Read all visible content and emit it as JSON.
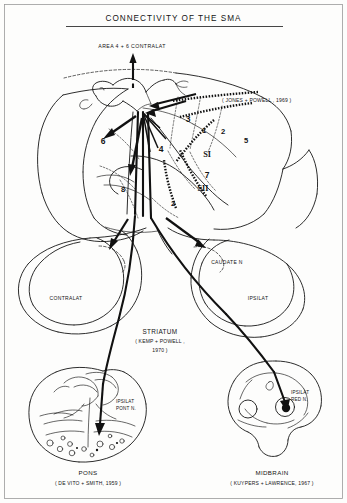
{
  "figure": {
    "title": "CONNECTIVITY OF THE SMA",
    "domain_note": "anatomical connectivity diagram of the supplementary motor area"
  },
  "cortex": {
    "top_arrow_label": "AREA 4 + 6 CONTRALAT",
    "citation": "( JONES + POWELL , 1969 )",
    "area_numbers": [
      {
        "id": "area-6",
        "label": "6"
      },
      {
        "id": "area-8",
        "label": "8"
      },
      {
        "id": "area-4",
        "label": "4"
      },
      {
        "id": "area-3",
        "label": "3"
      },
      {
        "id": "area-1",
        "label": "1"
      },
      {
        "id": "area-2-upper",
        "label": "2"
      },
      {
        "id": "area-5",
        "label": "5"
      },
      {
        "id": "area-7",
        "label": "7"
      },
      {
        "id": "area-2-lower",
        "label": "2"
      }
    ],
    "somatosensory": [
      {
        "id": "si",
        "label": "SI"
      },
      {
        "id": "sii",
        "label": "SII"
      }
    ]
  },
  "striatum": {
    "name": "STRIATUM",
    "citation_line1": "( KEMP + POWELL ,",
    "citation_line2": "1970 )",
    "caudate_label": "CAUDATE N",
    "side_left": "CONTRALAT",
    "side_right": "IPSILAT"
  },
  "pons": {
    "name": "PONS",
    "citation": "( DE VITO + SMITH, 1959 )",
    "nucleus_line1": "IPSILAT",
    "nucleus_line2": "PONT N."
  },
  "midbrain": {
    "name": "MIDBRAIN",
    "citation": "( KUYPERS + LAWRENCE, 1967 )",
    "nucleus_line1": "IPSILAT",
    "nucleus_line2": "RED N."
  },
  "colors": {
    "ink": "#161616",
    "paper": "#fdfdfc"
  }
}
